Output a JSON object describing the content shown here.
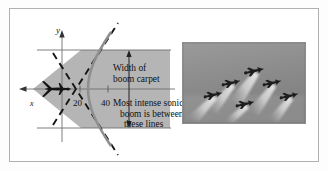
{
  "figure": {
    "kind": "textbook-figure",
    "panels": [
      "sonic-boom-hyperbola-diagram",
      "jet-formation-photograph"
    ]
  },
  "diagram": {
    "axis_y_label": "y",
    "axis_x_label": "x",
    "tick_labels": [
      "20",
      "40"
    ],
    "annotations": {
      "width_line1": "Width of",
      "width_line2": "boom carpet",
      "intense_line1": "Most intense sonic",
      "intense_line2": "boom is between",
      "intense_line3": "these lines"
    },
    "colors": {
      "carpet_fill": "#b5b5b5",
      "curve": "#8a8a8a",
      "asymptote": "#151515",
      "axis": "#6b6b6b",
      "text": "#111111"
    },
    "icons": {
      "aircraft": "airplane-icon",
      "y_axis_arrow": "arrow-up-icon",
      "x_axis_arrow": "arrow-left-icon",
      "width_arrow": "double-arrow-vertical-icon"
    }
  },
  "photo": {
    "subject": "six jet aircraft flying in formation with contrails",
    "aircraft_count": 6,
    "colors": {
      "sky": "#8f8f8f",
      "sky_light": "#ababab",
      "jet": "#1d1d1d",
      "contrail": "#e8e8e8",
      "frame": "#8d8d8d"
    },
    "aircraft_positions": [
      {
        "x": 30,
        "y": 52
      },
      {
        "x": 48,
        "y": 40
      },
      {
        "x": 62,
        "y": 61
      },
      {
        "x": 71,
        "y": 28
      },
      {
        "x": 89,
        "y": 40
      },
      {
        "x": 106,
        "y": 53
      }
    ]
  }
}
